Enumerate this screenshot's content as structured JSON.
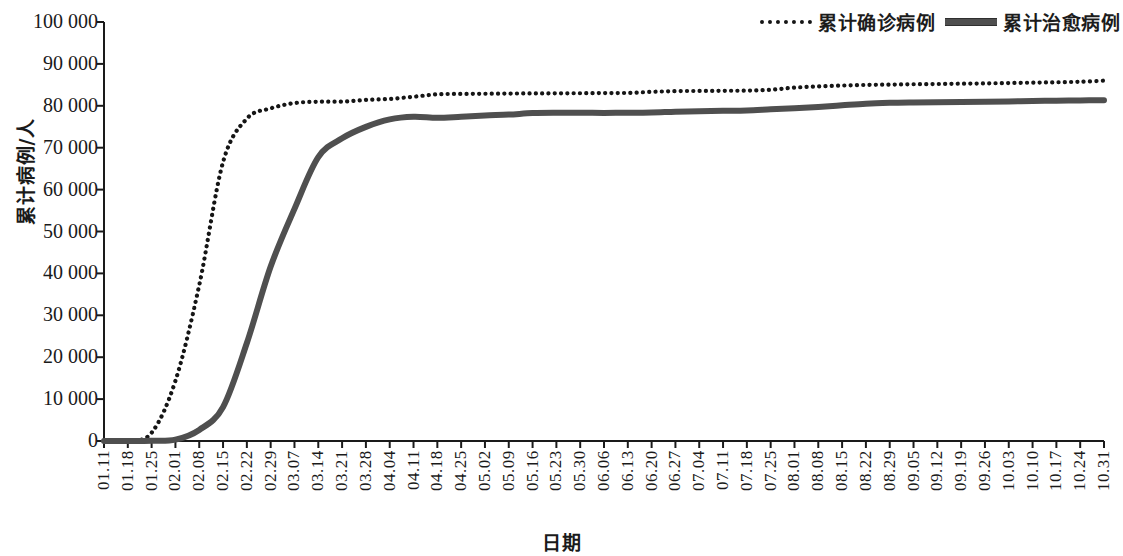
{
  "legend": {
    "entries": [
      {
        "label": "累计确诊病例",
        "style": "dotted",
        "color": "#151515"
      },
      {
        "label": "累计治愈病例",
        "style": "solid",
        "color": "#4f4f4f"
      }
    ]
  },
  "axes": {
    "y_title": "累计病例/人",
    "x_title": "日期",
    "y_ticks": [
      "100 000",
      "90 000",
      "80 000",
      "70 000",
      "60 000",
      "50 000",
      "40 000",
      "30 000",
      "20 000",
      "10 000",
      "0"
    ],
    "x_ticks": [
      "01.11",
      "01.18",
      "01.25",
      "02.01",
      "02.08",
      "02.15",
      "02.22",
      "02.29",
      "03.07",
      "03.14",
      "03.21",
      "03.28",
      "04.04",
      "04.11",
      "04.18",
      "04.25",
      "05.02",
      "05.09",
      "05.16",
      "05.23",
      "05.30",
      "06.06",
      "06.13",
      "06.20",
      "06.27",
      "07.04",
      "07.11",
      "07.18",
      "07.25",
      "08.01",
      "08.08",
      "08.15",
      "08.22",
      "08.29",
      "09.05",
      "09.12",
      "09.19",
      "09.26",
      "10.03",
      "10.10",
      "10.17",
      "10.24",
      "10.31"
    ]
  },
  "chart_data": {
    "type": "line",
    "title": "",
    "subtitle": "",
    "xlabel": "日期",
    "ylabel": "累计病例/人",
    "ylim": [
      0,
      100000
    ],
    "ytick_step": 10000,
    "grid": false,
    "legend_position": "top-right",
    "x": [
      "01.11",
      "01.18",
      "01.25",
      "02.01",
      "02.08",
      "02.15",
      "02.22",
      "02.29",
      "03.07",
      "03.14",
      "03.21",
      "03.28",
      "04.04",
      "04.11",
      "04.18",
      "04.25",
      "05.02",
      "05.09",
      "05.16",
      "05.23",
      "05.30",
      "06.06",
      "06.13",
      "06.20",
      "06.27",
      "07.04",
      "07.11",
      "07.18",
      "07.25",
      "08.01",
      "08.08",
      "08.15",
      "08.22",
      "08.29",
      "09.05",
      "09.12",
      "09.19",
      "09.26",
      "10.03",
      "10.10",
      "10.17",
      "10.24",
      "10.31"
    ],
    "series": [
      {
        "name": "累计确诊病例",
        "style": "dotted",
        "color": "#151515",
        "values": [
          41,
          62,
          1975,
          14380,
          37198,
          66576,
          76936,
          79394,
          80651,
          80977,
          81008,
          81394,
          81639,
          82160,
          82747,
          82827,
          82875,
          82918,
          82954,
          82971,
          83001,
          83043,
          83075,
          83325,
          83500,
          83542,
          83581,
          83622,
          83830,
          84337,
          84619,
          84827,
          84981,
          85058,
          85144,
          85202,
          85279,
          85337,
          85434,
          85521,
          85611,
          85747,
          85997
        ]
      },
      {
        "name": "累计治愈病例",
        "style": "solid",
        "color": "#4f4f4f",
        "values": [
          2,
          6,
          49,
          328,
          2649,
          8096,
          23383,
          41625,
          55404,
          67749,
          72244,
          74971,
          76755,
          77370,
          77123,
          77394,
          77685,
          77905,
          78261,
          78347,
          78336,
          78307,
          78330,
          78394,
          78575,
          78688,
          78797,
          78903,
          79157,
          79397,
          79730,
          80134,
          80517,
          80710,
          80793,
          80845,
          80903,
          80966,
          81048,
          81141,
          81230,
          81287,
          81339
        ]
      }
    ]
  }
}
